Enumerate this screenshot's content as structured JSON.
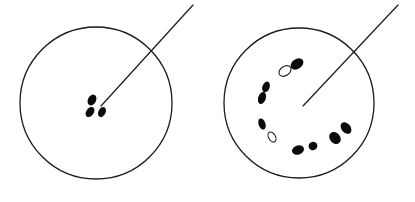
{
  "figure": {
    "title": "",
    "background_color": "#ffffff",
    "stroke_color": "#1a1a1a",
    "mark_fill_color": "#0a0a0a",
    "panel_count": 2,
    "width": 415,
    "height": 202
  },
  "panels": [
    {
      "id": "left-panel",
      "label": "",
      "circle": {
        "cx": 96,
        "cy": 103,
        "r": 76,
        "stroke_width": 1.3
      },
      "pointer": {
        "x1": 101,
        "y1": 106,
        "x2": 193,
        "y2": 5,
        "stroke_width": 1.2
      },
      "mark_count": 3,
      "hollow_count": 0,
      "marks": [
        {
          "cx": 92,
          "cy": 100,
          "rx": 4.0,
          "ry": 5.8,
          "rot": 28,
          "filled": true
        },
        {
          "cx": 90,
          "cy": 112,
          "rx": 3.8,
          "ry": 5.6,
          "rot": 34,
          "filled": true
        },
        {
          "cx": 102,
          "cy": 112,
          "rx": 3.6,
          "ry": 5.4,
          "rot": 26,
          "filled": true
        }
      ]
    },
    {
      "id": "right-panel",
      "label": "",
      "circle": {
        "cx": 299,
        "cy": 103,
        "r": 75,
        "stroke_width": 1.3
      },
      "pointer": {
        "x1": 303,
        "y1": 106,
        "x2": 398,
        "y2": 5,
        "stroke_width": 1.2
      },
      "mark_count": 10,
      "hollow_count": 2,
      "marks": [
        {
          "cx": 297,
          "cy": 64,
          "rx": 5.0,
          "ry": 7.0,
          "rot": 55,
          "filled": true
        },
        {
          "cx": 285,
          "cy": 71,
          "rx": 4.6,
          "ry": 6.6,
          "rot": 55,
          "filled": false
        },
        {
          "cx": 266,
          "cy": 87,
          "rx": 3.6,
          "ry": 5.6,
          "rot": 20,
          "filled": true
        },
        {
          "cx": 262,
          "cy": 98,
          "rx": 3.8,
          "ry": 6.2,
          "rot": 18,
          "filled": true
        },
        {
          "cx": 262,
          "cy": 124,
          "rx": 3.4,
          "ry": 5.8,
          "rot": 160,
          "filled": true
        },
        {
          "cx": 272,
          "cy": 137,
          "rx": 3.4,
          "ry": 5.4,
          "rot": 150,
          "filled": false
        },
        {
          "cx": 298,
          "cy": 150,
          "rx": 6.2,
          "ry": 4.6,
          "rot": 160,
          "filled": true
        },
        {
          "cx": 313,
          "cy": 146,
          "rx": 4.4,
          "ry": 4.2,
          "rot": 165,
          "filled": true
        },
        {
          "cx": 335,
          "cy": 138,
          "rx": 5.2,
          "ry": 6.6,
          "rot": 140,
          "filled": true
        },
        {
          "cx": 346,
          "cy": 128,
          "rx": 4.6,
          "ry": 6.4,
          "rot": 140,
          "filled": true
        }
      ]
    }
  ]
}
